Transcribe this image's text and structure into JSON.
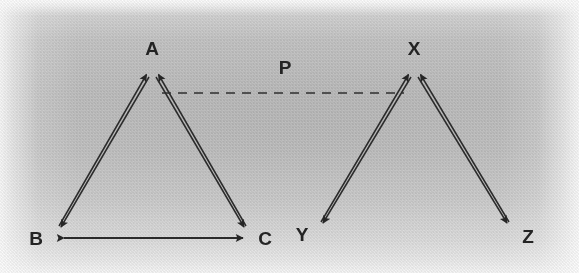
{
  "figure": {
    "background_color": "#c3c3c3",
    "ink_color": "#2a2a2a",
    "width": 579,
    "height": 273
  },
  "labels": {
    "a": "A",
    "b": "B",
    "c": "C",
    "x": "X",
    "y": "Y",
    "z": "Z",
    "p": "P"
  },
  "left_figure": {
    "name": "triangle-abc",
    "vertices": [
      {
        "id": "A",
        "label": "A",
        "x": 152,
        "y": 72,
        "label_x": 152,
        "label_y": 54
      },
      {
        "id": "B",
        "label": "B",
        "x": 58,
        "y": 231,
        "label_x": 36,
        "label_y": 240
      },
      {
        "id": "C",
        "label": "C",
        "x": 248,
        "y": 231,
        "label_x": 264,
        "label_y": 240
      }
    ],
    "edges": [
      {
        "name": "edge-b-to-a",
        "from": "B",
        "to": "A",
        "arrow_at": "A",
        "style": "solid"
      },
      {
        "name": "edge-c-to-a",
        "from": "C",
        "to": "A",
        "arrow_at": "A",
        "style": "solid"
      },
      {
        "name": "edge-a-to-b",
        "from": "A",
        "to": "B",
        "arrow_at": "B",
        "style": "solid"
      },
      {
        "name": "edge-b-c-double",
        "from": "B",
        "to": "C",
        "arrow_at": "both",
        "style": "solid"
      }
    ]
  },
  "right_figure": {
    "name": "triangle-xyz",
    "vertices": [
      {
        "id": "X",
        "label": "X",
        "x": 414,
        "y": 72,
        "label_x": 414,
        "label_y": 54
      },
      {
        "id": "Y",
        "label": "Y",
        "x": 320,
        "y": 227,
        "label_x": 302,
        "label_y": 236
      },
      {
        "id": "Z",
        "label": "Z",
        "x": 511,
        "y": 227,
        "label_x": 527,
        "label_y": 238
      }
    ],
    "edges": [
      {
        "name": "edge-y-to-x",
        "from": "Y",
        "to": "X",
        "arrow_at": "X",
        "style": "solid"
      },
      {
        "name": "edge-z-to-x",
        "from": "Z",
        "to": "X",
        "arrow_at": "X",
        "style": "solid"
      },
      {
        "name": "edge-x-to-y",
        "from": "X",
        "to": "Y",
        "arrow_at": "Y",
        "style": "solid"
      },
      {
        "name": "edge-x-to-z",
        "from": "X",
        "to": "Z",
        "arrow_at": "Z",
        "style": "solid"
      }
    ]
  },
  "dashed_line": {
    "name": "dashed-line-p",
    "label": "P",
    "x1": 162,
    "y1": 93,
    "x2": 404,
    "y2": 93,
    "dash_pattern": "9 7",
    "label_x": 285,
    "label_y": 72
  }
}
